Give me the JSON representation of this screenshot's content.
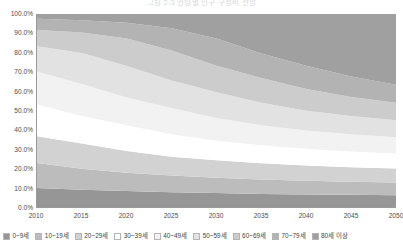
{
  "chart_data": {
    "type": "area",
    "title": "그림 2-3  연령별 인구 구성비 전망",
    "xlabel": "",
    "ylabel": "",
    "stacked": true,
    "normalized": true,
    "grid": false,
    "legend_position": "bottom",
    "ylim": [
      0,
      100
    ],
    "ytick_labels": [
      "100.0%",
      "90.0%",
      "80.0%",
      "70.0%",
      "60.0%",
      "50.0%",
      "40.0%",
      "30.0%",
      "20.0%",
      "10.0%",
      "0.0%"
    ],
    "ytick_values": [
      100,
      90,
      80,
      70,
      60,
      50,
      40,
      30,
      20,
      10,
      0
    ],
    "x": [
      2010,
      2015,
      2020,
      2025,
      2030,
      2035,
      2040,
      2045,
      2050
    ],
    "xtick_labels": [
      "2010",
      "2015",
      "2020",
      "2025",
      "2030",
      "2035",
      "2040",
      "2045",
      "2050"
    ],
    "series": [
      {
        "name": "0~9세",
        "color": "#969696",
        "values": [
          9.8,
          9.0,
          8.3,
          7.7,
          7.2,
          6.8,
          6.5,
          6.3,
          6.1
        ]
      },
      {
        "name": "10~19세",
        "color": "#bcbcbc",
        "values": [
          13.0,
          10.8,
          9.4,
          8.6,
          8.0,
          7.5,
          7.1,
          6.8,
          6.6
        ]
      },
      {
        "name": "20~29세",
        "color": "#d2d2d2",
        "values": [
          13.8,
          13.1,
          11.3,
          9.8,
          9.0,
          8.4,
          7.9,
          7.5,
          7.2
        ]
      },
      {
        "name": "30~39세",
        "color": "#ffffff",
        "values": [
          16.5,
          14.2,
          13.4,
          11.6,
          10.1,
          9.3,
          8.7,
          8.2,
          7.8
        ]
      },
      {
        "name": "40~49세",
        "color": "#f2f2f2",
        "values": [
          17.1,
          16.6,
          14.4,
          13.6,
          11.8,
          10.3,
          9.5,
          8.9,
          8.4
        ]
      },
      {
        "name": "50~59세",
        "color": "#e2e2e2",
        "values": [
          13.1,
          16.1,
          16.3,
          14.2,
          13.4,
          11.7,
          10.2,
          9.4,
          8.8
        ]
      },
      {
        "name": "60~69세",
        "color": "#cccccc",
        "values": [
          8.4,
          10.6,
          14.2,
          15.6,
          13.7,
          12.9,
          11.3,
          9.9,
          9.1
        ]
      },
      {
        "name": "70~79세",
        "color": "#b3b3b3",
        "values": [
          5.9,
          6.4,
          8.2,
          11.5,
          14.1,
          12.7,
          12.0,
          10.6,
          9.4
        ]
      },
      {
        "name": "80세 이상",
        "color": "#a0a0a0",
        "values": [
          2.4,
          3.2,
          4.5,
          7.4,
          12.7,
          20.4,
          26.8,
          32.4,
          36.6
        ]
      }
    ]
  }
}
